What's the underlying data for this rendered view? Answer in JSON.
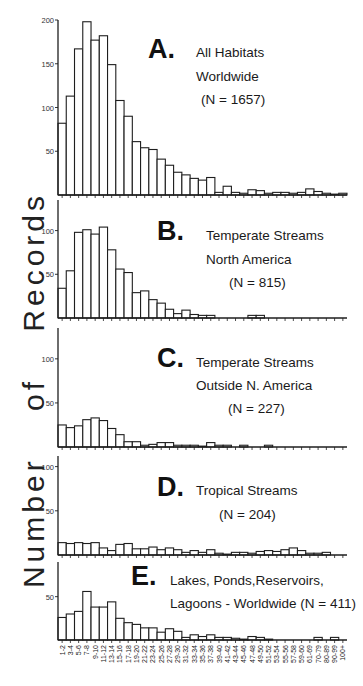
{
  "figure": {
    "ylabel": "Number of Records",
    "xcategories": [
      "1-2",
      "3-4",
      "5-6",
      "7-8",
      "9-10",
      "11-12",
      "13-14",
      "15-16",
      "17-18",
      "19-20",
      "21-22",
      "23-24",
      "25-26",
      "27-28",
      "29-30",
      "31-32",
      "33-34",
      "35-36",
      "37-38",
      "39-40",
      "41-42",
      "43-44",
      "45-46",
      "47-48",
      "49-50",
      "51-52",
      "53-54",
      "55-56",
      "57-58",
      "59-60",
      "61-69",
      "70-79",
      "80-89",
      "90-99",
      "100+"
    ]
  },
  "chart_data": [
    {
      "type": "bar",
      "panel": "A",
      "title": "All Habitats Worldwide",
      "title_lines": [
        "All Habitats",
        "Worldwide"
      ],
      "n_label": "(N = 1657)",
      "xlabel": "",
      "ylabel": "Number of Records",
      "ylim": [
        0,
        200
      ],
      "yticks": [
        50,
        100,
        150,
        200
      ],
      "categories": [
        "1-2",
        "3-4",
        "5-6",
        "7-8",
        "9-10",
        "11-12",
        "13-14",
        "15-16",
        "17-18",
        "19-20",
        "21-22",
        "23-24",
        "25-26",
        "27-28",
        "29-30",
        "31-32",
        "33-34",
        "35-36",
        "37-38",
        "39-40",
        "41-42",
        "43-44",
        "45-46",
        "47-48",
        "49-50",
        "51-52",
        "53-54",
        "55-56",
        "57-58",
        "59-60",
        "61-69",
        "70-79",
        "80-89",
        "90-99",
        "100+"
      ],
      "values": [
        82,
        113,
        167,
        198,
        177,
        182,
        149,
        108,
        90,
        61,
        54,
        52,
        41,
        34,
        26,
        23,
        19,
        17,
        20,
        3,
        10,
        3,
        2,
        6,
        5,
        2,
        3,
        3,
        2,
        3,
        7,
        4,
        2,
        1,
        2
      ]
    },
    {
      "type": "bar",
      "panel": "B",
      "title": "Temperate Streams North America",
      "title_lines": [
        "Temperate Streams",
        "North America"
      ],
      "n_label": "(N = 815)",
      "xlabel": "",
      "ylabel": "Number of Records",
      "ylim": [
        0,
        135
      ],
      "yticks": [
        50,
        100
      ],
      "categories": [
        "1-2",
        "3-4",
        "5-6",
        "7-8",
        "9-10",
        "11-12",
        "13-14",
        "15-16",
        "17-18",
        "19-20",
        "21-22",
        "23-24",
        "25-26",
        "27-28",
        "29-30",
        "31-32",
        "33-34",
        "35-36",
        "37-38",
        "39-40",
        "41-42",
        "43-44",
        "45-46",
        "47-48",
        "49-50",
        "51-52",
        "53-54",
        "55-56",
        "57-58",
        "59-60",
        "61-69",
        "70-79",
        "80-89",
        "90-99",
        "100+"
      ],
      "values": [
        34,
        54,
        98,
        101,
        96,
        104,
        78,
        56,
        52,
        29,
        31,
        21,
        17,
        10,
        5,
        9,
        4,
        3,
        3,
        0,
        0,
        0,
        0,
        3,
        3,
        0,
        0,
        0,
        0,
        0,
        0,
        0,
        0,
        0,
        0
      ]
    },
    {
      "type": "bar",
      "panel": "C",
      "title": "Temperate Streams Outside N. America",
      "title_lines": [
        "Temperate Streams",
        "Outside N. America"
      ],
      "n_label": "(N = 227)",
      "xlabel": "",
      "ylabel": "Number of Records",
      "ylim": [
        0,
        135
      ],
      "yticks": [
        50,
        100
      ],
      "categories": [
        "1-2",
        "3-4",
        "5-6",
        "7-8",
        "9-10",
        "11-12",
        "13-14",
        "15-16",
        "17-18",
        "19-20",
        "21-22",
        "23-24",
        "25-26",
        "27-28",
        "29-30",
        "31-32",
        "33-34",
        "35-36",
        "37-38",
        "39-40",
        "41-42",
        "43-44",
        "45-46",
        "47-48",
        "49-50",
        "51-52",
        "53-54",
        "55-56",
        "57-58",
        "59-60",
        "61-69",
        "70-79",
        "80-89",
        "90-99",
        "100+"
      ],
      "values": [
        25,
        22,
        24,
        31,
        33,
        30,
        21,
        14,
        6,
        6,
        2,
        3,
        5,
        5,
        2,
        2,
        2,
        1,
        5,
        2,
        2,
        0,
        2,
        0,
        0,
        2,
        0,
        0,
        0,
        0,
        0,
        0,
        0,
        0,
        0
      ]
    },
    {
      "type": "bar",
      "panel": "D",
      "title": "Tropical Streams",
      "title_lines": [
        "Tropical Streams"
      ],
      "n_label": "(N = 204)",
      "xlabel": "",
      "ylabel": "Number of Records",
      "ylim": [
        0,
        112
      ],
      "yticks": [
        50,
        100
      ],
      "categories": [
        "1-2",
        "3-4",
        "5-6",
        "7-8",
        "9-10",
        "11-12",
        "13-14",
        "15-16",
        "17-18",
        "19-20",
        "21-22",
        "23-24",
        "25-26",
        "27-28",
        "29-30",
        "31-32",
        "33-34",
        "35-36",
        "37-38",
        "39-40",
        "41-42",
        "43-44",
        "45-46",
        "47-48",
        "49-50",
        "51-52",
        "53-54",
        "55-56",
        "57-58",
        "59-60",
        "61-69",
        "70-79",
        "80-89",
        "90-99",
        "100+"
      ],
      "values": [
        14,
        13,
        14,
        13,
        14,
        8,
        5,
        12,
        13,
        7,
        7,
        9,
        6,
        8,
        6,
        3,
        5,
        3,
        6,
        2,
        1,
        3,
        3,
        2,
        4,
        5,
        4,
        6,
        8,
        5,
        2,
        2,
        3,
        0,
        0
      ]
    },
    {
      "type": "bar",
      "panel": "E",
      "title": "Lakes, Ponds,Reservoirs, Lagoons - Worldwide",
      "title_lines": [
        "Lakes, Ponds,Reservoirs,",
        "Lagoons - Worldwide (N = 411)"
      ],
      "n_label": "(N = 411)",
      "xlabel": "",
      "ylabel": "Number of Records",
      "ylim": [
        0,
        90
      ],
      "yticks": [
        50
      ],
      "categories": [
        "1-2",
        "3-4",
        "5-6",
        "7-8",
        "9-10",
        "11-12",
        "13-14",
        "15-16",
        "17-18",
        "19-20",
        "21-22",
        "23-24",
        "25-26",
        "27-28",
        "29-30",
        "31-32",
        "33-34",
        "35-36",
        "37-38",
        "39-40",
        "41-42",
        "43-44",
        "45-46",
        "47-48",
        "49-50",
        "51-52",
        "53-54",
        "55-56",
        "57-58",
        "59-60",
        "61-69",
        "70-79",
        "80-89",
        "90-99",
        "100+"
      ],
      "values": [
        26,
        30,
        33,
        56,
        38,
        38,
        44,
        25,
        20,
        18,
        14,
        14,
        9,
        13,
        10,
        3,
        6,
        4,
        6,
        3,
        3,
        2,
        1,
        4,
        3,
        1,
        0,
        0,
        0,
        0,
        0,
        3,
        0,
        3,
        0
      ]
    }
  ]
}
